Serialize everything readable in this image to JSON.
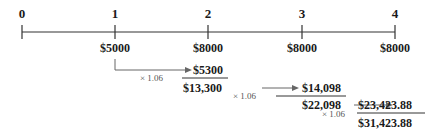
{
  "timeline": {
    "periods": [
      "0",
      "1",
      "2",
      "3",
      "4"
    ],
    "cash_flows": [
      "",
      "$5000",
      "$8000",
      "$8000",
      "$8000"
    ]
  },
  "steps": [
    {
      "multiplier": "× 1.06",
      "grown": "$5300",
      "sum": "$13,300"
    },
    {
      "multiplier": "× 1.06",
      "grown": "$14,098",
      "sum": "$22,098"
    },
    {
      "multiplier": "× 1.06",
      "grown": "$23,423.88",
      "sum": "$31,423.88"
    }
  ],
  "colors": {
    "line": "#333333",
    "arrow": "#666666"
  }
}
